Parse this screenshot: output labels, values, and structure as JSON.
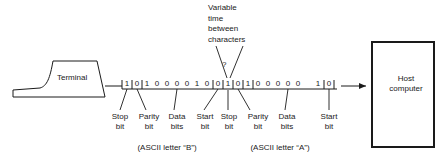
{
  "diagram": {
    "terminal": {
      "label": "Terminal"
    },
    "host": {
      "line1": "Host",
      "line2": "computer"
    },
    "annotation": {
      "line1": "Variable",
      "line2": "time",
      "line3": "between",
      "line4": "characters",
      "marker": "?"
    },
    "character_b": {
      "caption": "(ASCII letter “B”)",
      "bits": [
        "1",
        "0",
        "1",
        "0",
        "0",
        "0",
        "0",
        "1",
        "0",
        "0"
      ],
      "fields": [
        {
          "name": "stop-bit",
          "line1": "Stop",
          "line2": "bit"
        },
        {
          "name": "parity-bit",
          "line1": "Parity",
          "line2": "bit"
        },
        {
          "name": "data-bits",
          "line1": "Data",
          "line2": "bits"
        },
        {
          "name": "start-bit",
          "line1": "Start",
          "line2": "bit"
        }
      ]
    },
    "character_a": {
      "caption": "(ASCII letter “A”)",
      "bits": [
        "1",
        "0",
        "1",
        "0",
        "0",
        "0",
        "0",
        "0",
        "1",
        "0"
      ],
      "fields": [
        {
          "name": "stop-bit",
          "line1": "Stop",
          "line2": "bit"
        },
        {
          "name": "parity-bit",
          "line1": "Parity",
          "line2": "bit"
        },
        {
          "name": "data-bits",
          "line1": "Data",
          "line2": "bits"
        },
        {
          "name": "start-bit",
          "line1": "Start",
          "line2": "bit"
        }
      ]
    },
    "colors": {
      "ink": "#1a1a1a",
      "paper": "#ffffff"
    }
  }
}
